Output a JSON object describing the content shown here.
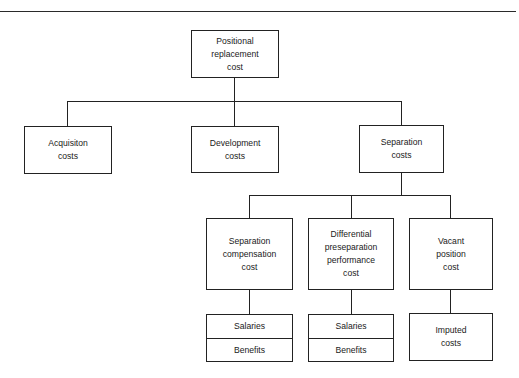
{
  "diagram": {
    "root": {
      "label": "Positional\nreplacement\ncost"
    },
    "level1": [
      {
        "label": "Acquisiton\ncosts"
      },
      {
        "label": "Development\ncosts"
      },
      {
        "label": "Separation\ncosts"
      }
    ],
    "level2": [
      {
        "label": "Separation\ncompensation\ncost",
        "children": [
          "Salaries",
          "Benefits"
        ]
      },
      {
        "label": "Differential\npreseparation\nperformance\ncost",
        "children": [
          "Salaries",
          "Benefits"
        ]
      },
      {
        "label": "Vacant\nposition\ncost",
        "children": [
          "Imputed\ncosts"
        ]
      }
    ]
  }
}
